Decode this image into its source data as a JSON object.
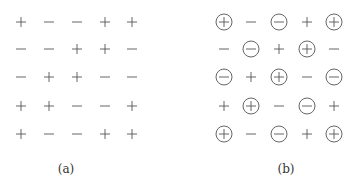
{
  "figure": {
    "panels": [
      {
        "label": "(a)",
        "grid": [
          [
            "+",
            "-",
            "-",
            "+",
            "+"
          ],
          [
            "-",
            "-",
            "+",
            "+",
            "-"
          ],
          [
            "-",
            "+",
            "+",
            "-",
            "-"
          ],
          [
            "+",
            "+",
            "-",
            "-",
            "+"
          ],
          [
            "+",
            "-",
            "-",
            "+",
            "+"
          ]
        ],
        "circled": [
          [
            false,
            false,
            false,
            false,
            false
          ],
          [
            false,
            false,
            false,
            false,
            false
          ],
          [
            false,
            false,
            false,
            false,
            false
          ],
          [
            false,
            false,
            false,
            false,
            false
          ],
          [
            false,
            false,
            false,
            false,
            false
          ]
        ]
      },
      {
        "label": "(b)",
        "grid": [
          [
            "+",
            "-",
            "-",
            "+",
            "+"
          ],
          [
            "-",
            "-",
            "+",
            "+",
            "-"
          ],
          [
            "-",
            "+",
            "+",
            "-",
            "-"
          ],
          [
            "+",
            "+",
            "-",
            "-",
            "+"
          ],
          [
            "+",
            "-",
            "-",
            "+",
            "+"
          ]
        ],
        "circled": [
          [
            true,
            false,
            true,
            false,
            true
          ],
          [
            false,
            true,
            false,
            true,
            false
          ],
          [
            true,
            false,
            true,
            false,
            true
          ],
          [
            false,
            true,
            false,
            true,
            false
          ],
          [
            true,
            false,
            true,
            false,
            true
          ]
        ]
      }
    ],
    "colors": {
      "symbol": "#555555",
      "circle": "#555555",
      "caption": "#333333"
    }
  }
}
